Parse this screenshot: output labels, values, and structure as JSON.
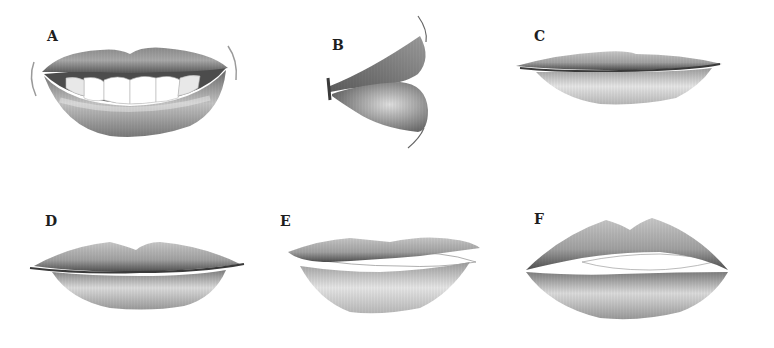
{
  "figure": {
    "panels": [
      {
        "id": "A",
        "label": "A",
        "subject": "smiling open lips showing upper teeth"
      },
      {
        "id": "B",
        "label": "B",
        "subject": "lips in side profile"
      },
      {
        "id": "C",
        "label": "C",
        "subject": "thin closed lips"
      },
      {
        "id": "D",
        "label": "D",
        "subject": "full closed lips with cupid's bow"
      },
      {
        "id": "E",
        "label": "E",
        "subject": "slightly parted lips showing teeth edges"
      },
      {
        "id": "F",
        "label": "F",
        "subject": "full parted lips with pronounced cupid's bow"
      }
    ]
  },
  "colors": {
    "background": "#ffffff",
    "pencil_dark": "#3a3a3a",
    "pencil_mid": "#8a8a8a",
    "pencil_light": "#cfcfcf",
    "teeth": "#ffffff"
  }
}
